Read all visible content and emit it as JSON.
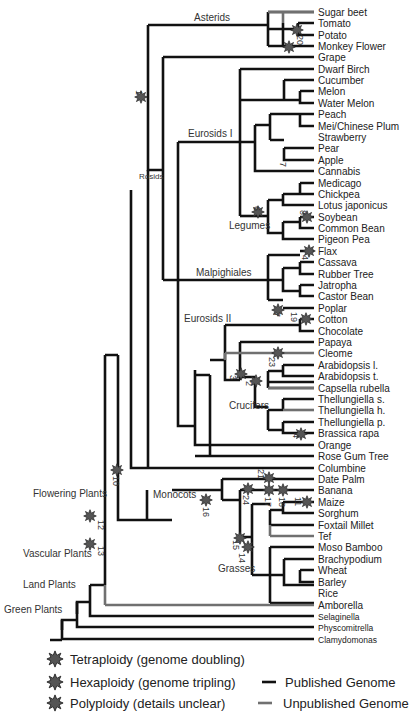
{
  "colors": {
    "published": "#111111",
    "unpublished": "#6a6a6a",
    "tetraploidy": "#555555",
    "hexaploidy": "#222222",
    "polyploidy": "#444444"
  },
  "leaves": [
    "Sugar beet",
    "Tomato",
    "Potato",
    "Monkey Flower",
    "Grape",
    "Dwarf Birch",
    "Cucumber",
    "Melon",
    "Water Melon",
    "Peach",
    "Mei/Chinese Plum",
    "Strawberry",
    "Pear",
    "Apple",
    "Cannabis",
    "Medicago",
    "Chickpea",
    "Lotus japonicus",
    "Soybean",
    "Common Bean",
    "Pigeon Pea",
    "Flax",
    "Cassava",
    "Rubber Tree",
    "Jatropha",
    "Castor Bean",
    "Poplar",
    "Cotton",
    "Chocolate",
    "Papaya",
    "Cleome",
    "Arabidopsis l.",
    "Arabidopsis t.",
    "Capsella rubella",
    "Thellungiella s.",
    "Thellungiella h.",
    "Thellungiella p.",
    "Brassica rapa",
    "Orange",
    "Rose Gum Tree",
    "Columbine",
    "Date Palm",
    "Banana",
    "Maize",
    "Sorghum",
    "Foxtail Millet",
    "Tef",
    "Moso Bamboo",
    "Brachypodium",
    "Wheat",
    "Barley",
    "Rice",
    "Amborella",
    "Selaginella",
    "Physcomitrella",
    "Clamydomonas"
  ],
  "clades": {
    "asterids": "Asterids",
    "rosids": "Rosids",
    "eurosids1": "Eurosids I",
    "legumes": "Legumes",
    "malpighiales": "Malpighiales",
    "eurosids2": "Eurosids II",
    "crucifers": "Crucifers",
    "monocots": "Monocots",
    "grasses": "Grasses",
    "flowering": "Flowering Plants",
    "vascular": "Vascular Plants",
    "land": "Land Plants",
    "green": "Green Plants"
  },
  "events": [
    "1",
    "2",
    "3",
    "4",
    "6",
    "7",
    "8",
    "9",
    "10",
    "11",
    "12",
    "13",
    "14",
    "15",
    "16",
    "17",
    "18",
    "19",
    "20",
    "21",
    "23",
    "24"
  ],
  "legend": {
    "tetraploidy": "Tetraploidy (genome doubling)",
    "hexaploidy": "Hexaploidy (genome tripling)",
    "polyploidy": "Polyploidy (details unclear)",
    "published": "Published Genome",
    "unpublished": "Unpublished Genome"
  }
}
